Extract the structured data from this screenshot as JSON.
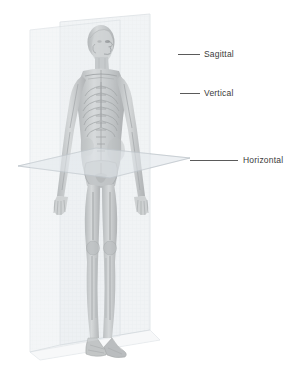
{
  "illustration": {
    "title": "Anatomical planes of the human body",
    "subject": "anatomical-figure-male-standing",
    "background_color": "#ffffff",
    "line_color": "#5a5a5a",
    "text_color": "#3a3a3a",
    "plane_fill_color": "#e8ecef",
    "plane_edge_color": "#c8cfd4",
    "body_color": "#b9bcbd",
    "bone_color": "#8d9193"
  },
  "annotations": [
    {
      "id": "sagittal",
      "label": "Sagittal",
      "leader_x": 178,
      "leader_y": 54,
      "leader_width": 22,
      "label_x": 204,
      "label_y": 49
    },
    {
      "id": "vertical",
      "label": "Vertical",
      "leader_x": 180,
      "leader_y": 93,
      "leader_width": 20,
      "label_x": 204,
      "label_y": 88
    },
    {
      "id": "horizontal",
      "label": "Horizontal",
      "leader_x": 190,
      "leader_y": 160,
      "leader_width": 48,
      "label_x": 243,
      "label_y": 155
    }
  ],
  "planes": [
    {
      "id": "sagittal-plane",
      "name": "Sagittal",
      "orientation": "vertical-front-back"
    },
    {
      "id": "vertical-plane",
      "name": "Vertical",
      "orientation": "vertical-left-right"
    },
    {
      "id": "horizontal-plane",
      "name": "Horizontal",
      "orientation": "transverse"
    }
  ]
}
